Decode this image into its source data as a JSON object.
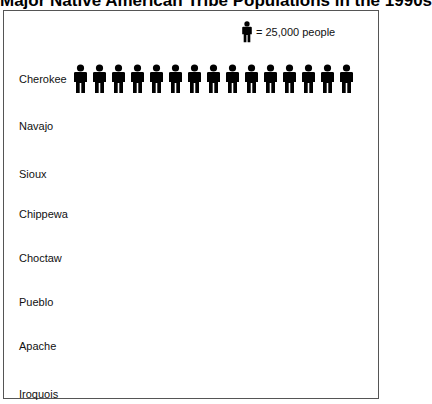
{
  "title": "Major Native American Tribe Populations in the 1990s",
  "legend": {
    "icon": "person-icon",
    "text": "= 25,000 people",
    "unit_value": 25000
  },
  "rows": [
    {
      "label": "Cherokee",
      "icons": 15
    },
    {
      "label": "Navajo",
      "icons": 0
    },
    {
      "label": "Sioux",
      "icons": 0
    },
    {
      "label": "Chippewa",
      "icons": 0
    },
    {
      "label": "Choctaw",
      "icons": 0
    },
    {
      "label": "Pueblo",
      "icons": 0
    },
    {
      "label": "Apache",
      "icons": 0
    },
    {
      "label": "Iroquois",
      "icons": 0
    }
  ],
  "chart_data": {
    "type": "pictograph",
    "title": "Major Native American Tribe Populations in the 1990s",
    "categories": [
      "Cherokee",
      "Navajo",
      "Sioux",
      "Chippewa",
      "Choctaw",
      "Pueblo",
      "Apache",
      "Iroquois"
    ],
    "icon_counts": [
      15,
      0,
      0,
      0,
      0,
      0,
      0,
      0
    ],
    "values": [
      375000,
      0,
      0,
      0,
      0,
      0,
      0,
      0
    ],
    "unit": "people",
    "icon_value": 25000,
    "legend": "= 25,000 people",
    "legend_position": "top-right"
  }
}
